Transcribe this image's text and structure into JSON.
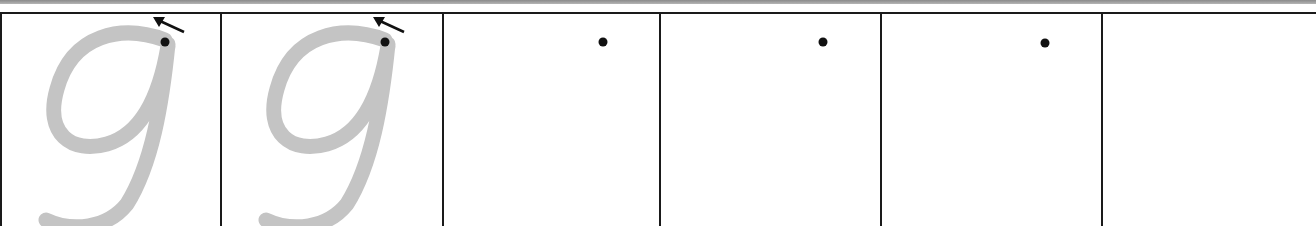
{
  "worksheet": {
    "letter": "g",
    "cells": [
      {
        "index": 0,
        "type": "traced-letter",
        "letter": "g",
        "start_dot": true,
        "direction_arrow": true
      },
      {
        "index": 1,
        "type": "traced-letter",
        "letter": "g",
        "start_dot": true,
        "direction_arrow": true
      },
      {
        "index": 2,
        "type": "blank-with-dot",
        "start_dot": true
      },
      {
        "index": 3,
        "type": "blank-with-dot",
        "start_dot": true
      },
      {
        "index": 4,
        "type": "blank-with-dot",
        "start_dot": true
      },
      {
        "index": 5,
        "type": "blank"
      }
    ],
    "colors": {
      "trace_stroke": "#c4c4c4",
      "border": "#1a1a1a",
      "dot": "#111111",
      "background": "#ffffff"
    }
  }
}
